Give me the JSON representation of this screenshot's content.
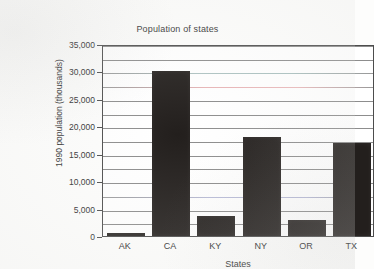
{
  "chart_data": {
    "type": "bar",
    "title": "Population of states",
    "xlabel": "States",
    "ylabel": "1990 population (thousands)",
    "categories": [
      "AK",
      "CA",
      "KY",
      "NY",
      "OR",
      "TX"
    ],
    "values": [
      550,
      30000,
      3700,
      18000,
      2850,
      17000
    ],
    "series": [
      {
        "name": "1990 population",
        "values": [
          550,
          30000,
          3700,
          18000,
          2850,
          17000
        ]
      }
    ],
    "ylim": [
      0,
      35000
    ],
    "yticks": [
      0,
      5000,
      10000,
      15000,
      20000,
      25000,
      30000,
      35000
    ],
    "ytick_labels": [
      "0",
      "5,000",
      "10,000",
      "15,000",
      "20,000",
      "25,000",
      "30,000",
      "35,000"
    ],
    "minor_gridline_interval": 2500,
    "grid": "horizontal",
    "legend": "none",
    "bar_color": "#231f1d",
    "panel_color": "#ffffff",
    "gridline_color": "#8d8d8d",
    "axis_color": "#4d4d4d"
  }
}
